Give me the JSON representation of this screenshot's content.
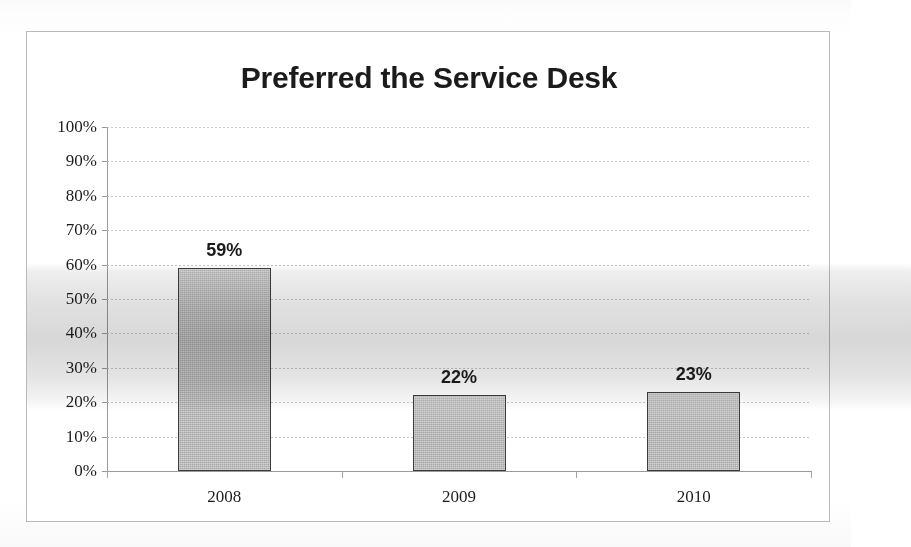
{
  "chart_data": {
    "type": "bar",
    "title": "Preferred the Service Desk",
    "xlabel": "",
    "ylabel": "",
    "categories": [
      "2008",
      "2009",
      "2010"
    ],
    "values": [
      59,
      22,
      23
    ],
    "value_labels": [
      "59%",
      "22%",
      "23%"
    ],
    "ylim": [
      0,
      100
    ],
    "y_ticks": [
      100,
      90,
      80,
      70,
      60,
      50,
      40,
      30,
      20,
      10,
      0
    ],
    "y_tick_labels": [
      "100%",
      "90%",
      "80%",
      "70%",
      "60%",
      "50%",
      "40%",
      "30%",
      "20%",
      "10%",
      "0%"
    ],
    "grid": true,
    "legend": false,
    "series": [
      {
        "name": "Preferred the Service Desk",
        "values": [
          59,
          22,
          23
        ],
        "color": "#a9a9a9",
        "border_color": "#3d3d3d"
      }
    ],
    "colors": {
      "bar_fill": "#a9a9a9",
      "bar_border": "#3d3d3d",
      "axis": "#9a9a9a",
      "gridline": "#bdbdbd",
      "text": "#1d1d1d",
      "title": "#1b1b1b",
      "frame_border": "#b9b9b9",
      "background": "#ffffff"
    }
  }
}
